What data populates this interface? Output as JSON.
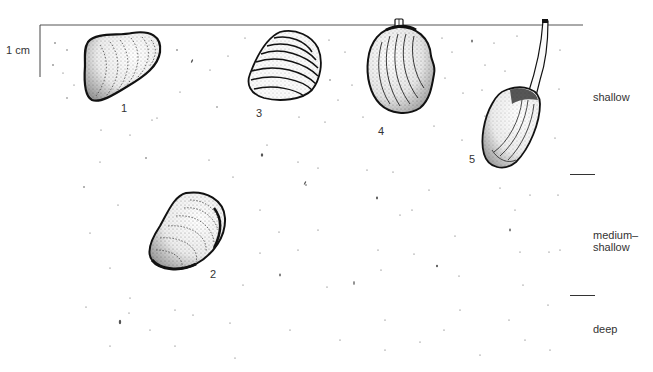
{
  "scale": {
    "label": "1 cm"
  },
  "specimens": [
    {
      "id": "1",
      "label": "1",
      "depth_zone": "shallow"
    },
    {
      "id": "2",
      "label": "2",
      "depth_zone": "medium-shallow"
    },
    {
      "id": "3",
      "label": "3",
      "depth_zone": "shallow"
    },
    {
      "id": "4",
      "label": "4",
      "depth_zone": "shallow"
    },
    {
      "id": "5",
      "label": "5",
      "depth_zone": "shallow"
    }
  ],
  "depth_zones": [
    {
      "label": "shallow"
    },
    {
      "label_line1": "medium–",
      "label_line2": "shallow"
    },
    {
      "label": "deep"
    }
  ],
  "colors": {
    "ink": "#1a1a1a",
    "surface_line": "#555555",
    "background": "#ffffff"
  }
}
